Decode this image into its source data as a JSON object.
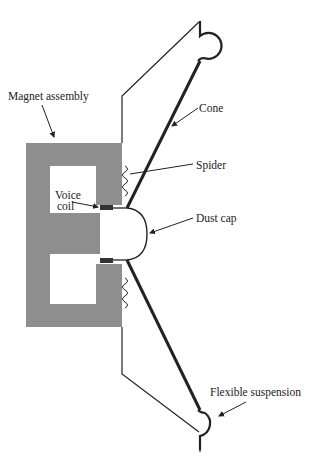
{
  "diagram": {
    "colors": {
      "magnet": "#8e8e8e",
      "line": "#222222",
      "coil": "#333333",
      "background": "#ffffff"
    },
    "labels": {
      "magnet_assembly": "Magnet assembly",
      "cone": "Cone",
      "spider": "Spider",
      "voice_coil_line1": "Voice",
      "voice_coil_line2": "coil",
      "dust_cap": "Dust cap",
      "flexible_suspension": "Flexible suspension"
    }
  }
}
